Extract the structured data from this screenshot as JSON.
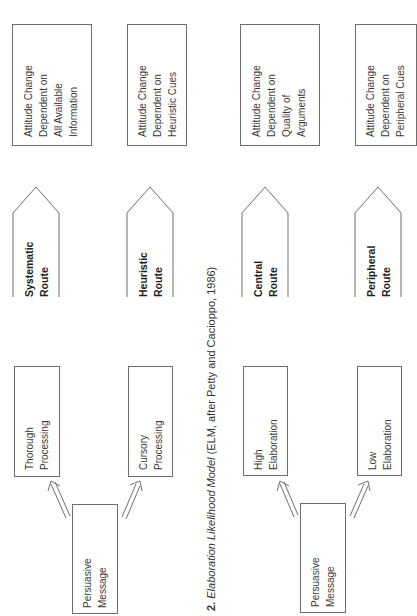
{
  "caption": {
    "number": "2.",
    "title_italic": "Elaboration Likelihood Model",
    "suffix": " (ELM, after Petty and Cacioppo, 1986)"
  },
  "models": [
    {
      "name": "HSM",
      "message": [
        "Persuasive",
        "Message"
      ],
      "branches": [
        {
          "process": [
            "Thorough",
            "Processing"
          ],
          "route": [
            "Systematic",
            "Route"
          ],
          "outcome": [
            "Attitude Change",
            "Dependent on",
            "All Available",
            "Information"
          ]
        },
        {
          "process": [
            "Cursory",
            "Processing"
          ],
          "route": [
            "Heuristic",
            "Route"
          ],
          "outcome": [
            "Attitude Change",
            "Dependent on",
            "Heuristic Cues"
          ]
        }
      ]
    },
    {
      "name": "ELM",
      "message": [
        "Persuasive",
        "Message"
      ],
      "branches": [
        {
          "process": [
            "High",
            "Elaboration"
          ],
          "route": [
            "Central",
            "Route"
          ],
          "outcome": [
            "Attitude Change",
            "Dependent on",
            "Quality of",
            "Arguments"
          ]
        },
        {
          "process": [
            "Low",
            "Elaboration"
          ],
          "route": [
            "Peripheral",
            "Route"
          ],
          "outcome": [
            "Attitude Change",
            "Dependent on",
            "Peripheral Cues"
          ]
        }
      ]
    }
  ],
  "colors": {
    "line": "#6e6e6e",
    "text": "#3a3a3a",
    "background": "#ffffff"
  }
}
